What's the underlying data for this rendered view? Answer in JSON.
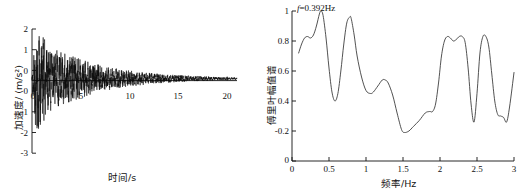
{
  "figure": {
    "panels": [
      {
        "id": "acceleration-time-history",
        "xlabel": "时间/s",
        "ylabel": "加速度/ (m/s²)",
        "xticks": [
          "0",
          "5",
          "10",
          "15",
          "20"
        ],
        "yticks": [
          "2",
          "1",
          "0",
          "0",
          "-1",
          "-2",
          "-3"
        ]
      },
      {
        "id": "fourier-amplitude-spectrum",
        "xlabel": "频率/Hz",
        "ylabel": "傅里叶幅值谱",
        "annotation_prefix": "f",
        "annotation_value": "=0.392Hz",
        "xticks": [
          "0",
          "0.5",
          "1",
          "1.5",
          "2",
          "2.5",
          "3"
        ],
        "yticks": [
          "1",
          "0.8",
          "0.6",
          "0.4",
          "-0.2",
          "0"
        ]
      }
    ]
  },
  "chart_data": [
    {
      "type": "line",
      "id": "acceleration-time-history",
      "title": "",
      "xlabel": "时间/s",
      "ylabel": "加速度/ (m/s²)",
      "xlim": [
        0,
        21
      ],
      "ylim": [
        -3,
        2
      ],
      "xticks": [
        0,
        5,
        10,
        15,
        20
      ],
      "yticks": [
        -3,
        -2,
        -1,
        0,
        1,
        2
      ],
      "grid": false,
      "legend": "none",
      "description": "Decaying random seismic accelerogram; peak positive ~2.0 m/s² and peak negative ~-2.4 m/s² near t≈0.6 s, amplitude decaying to ~±0.05 m/s² by t=20 s",
      "envelope_x": [
        0,
        0.3,
        0.6,
        1.0,
        1.5,
        2.0,
        3.0,
        4.0,
        5.0,
        6.0,
        7.0,
        8.0,
        9.0,
        10.0,
        11.0,
        12.0,
        13.0,
        14.0,
        15.0,
        16.0,
        17.0,
        18.0,
        19.0,
        20.0
      ],
      "envelope_upper": [
        0.05,
        1.55,
        2.0,
        1.75,
        1.45,
        1.25,
        1.05,
        0.92,
        0.78,
        0.64,
        0.54,
        0.45,
        0.38,
        0.32,
        0.27,
        0.23,
        0.19,
        0.16,
        0.14,
        0.12,
        0.1,
        0.085,
        0.07,
        0.05
      ],
      "envelope_lower": [
        -0.05,
        -1.75,
        -2.4,
        -1.85,
        -1.5,
        -1.25,
        -1.05,
        -0.92,
        -0.78,
        -0.64,
        -0.54,
        -0.45,
        -0.38,
        -0.32,
        -0.27,
        -0.23,
        -0.19,
        -0.16,
        -0.14,
        -0.12,
        -0.1,
        -0.085,
        -0.07,
        -0.05
      ],
      "dominant_frequency_hz": 5.5
    },
    {
      "type": "line",
      "id": "fourier-amplitude-spectrum",
      "title": "",
      "xlabel": "频率/Hz",
      "ylabel": "傅里叶幅值谱",
      "xlim": [
        0,
        3
      ],
      "ylim": [
        0,
        1
      ],
      "xticks": [
        0,
        0.5,
        1,
        1.5,
        2,
        2.5,
        3
      ],
      "yticks": [
        0,
        0.2,
        0.4,
        0.6,
        0.8,
        1
      ],
      "grid": false,
      "legend": "none",
      "annotation": "f=0.392Hz",
      "annotation_x": 0.392,
      "annotation_y": 1.0,
      "x": [
        0.09,
        0.13,
        0.17,
        0.21,
        0.25,
        0.29,
        0.33,
        0.37,
        0.392,
        0.42,
        0.46,
        0.5,
        0.54,
        0.58,
        0.62,
        0.66,
        0.7,
        0.74,
        0.78,
        0.8,
        0.84,
        0.88,
        0.94,
        1.0,
        1.06,
        1.1,
        1.16,
        1.22,
        1.26,
        1.3,
        1.36,
        1.42,
        1.48,
        1.52,
        1.58,
        1.64,
        1.72,
        1.8,
        1.86,
        1.9,
        1.94,
        1.98,
        2.02,
        2.06,
        2.1,
        2.14,
        2.18,
        2.22,
        2.26,
        2.3,
        2.34,
        2.38,
        2.42,
        2.46,
        2.5,
        2.54,
        2.58,
        2.62,
        2.66,
        2.7,
        2.74,
        2.78,
        2.82,
        2.86,
        2.9,
        2.94,
        3.0
      ],
      "y": [
        0.72,
        0.78,
        0.82,
        0.83,
        0.82,
        0.84,
        0.9,
        0.98,
        1.0,
        0.97,
        0.82,
        0.62,
        0.46,
        0.4,
        0.45,
        0.6,
        0.78,
        0.92,
        0.96,
        0.95,
        0.84,
        0.7,
        0.56,
        0.47,
        0.45,
        0.46,
        0.5,
        0.54,
        0.54,
        0.52,
        0.44,
        0.32,
        0.21,
        0.19,
        0.2,
        0.23,
        0.27,
        0.32,
        0.33,
        0.33,
        0.38,
        0.52,
        0.7,
        0.8,
        0.83,
        0.82,
        0.8,
        0.81,
        0.83,
        0.83,
        0.79,
        0.62,
        0.38,
        0.26,
        0.45,
        0.72,
        0.83,
        0.83,
        0.76,
        0.58,
        0.4,
        0.31,
        0.3,
        0.29,
        0.26,
        0.36,
        0.59
      ],
      "peaks": [
        {
          "f": 0.392,
          "amp": 1.0
        },
        {
          "f": 0.78,
          "amp": 0.96
        },
        {
          "f": 1.26,
          "amp": 0.54
        },
        {
          "f": 2.12,
          "amp": 0.83
        },
        {
          "f": 2.28,
          "amp": 0.83
        },
        {
          "f": 2.58,
          "amp": 0.83
        }
      ]
    }
  ]
}
